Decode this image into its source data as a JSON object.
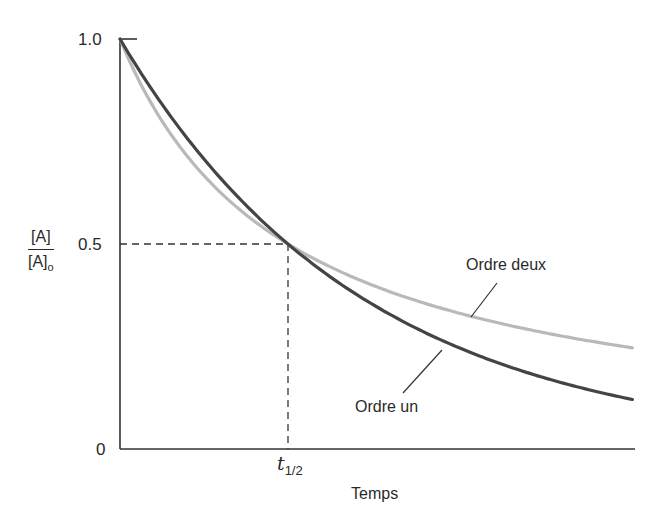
{
  "chart_data": {
    "type": "line",
    "title": "",
    "xlabel": "Temps",
    "ylabel": "[A]/[A]o",
    "ylabel_parts": {
      "numerator": "[A]",
      "denominator": "[A]",
      "denominator_sub": "o"
    },
    "yticks": [
      "0",
      "0.5",
      "1.0"
    ],
    "xticks": [
      {
        "label": "t",
        "sub": "1/2",
        "x": 1
      }
    ],
    "ylim": [
      0,
      1.0
    ],
    "xlim": [
      0,
      3.05
    ],
    "x_units": "multiples of t1/2",
    "grid": false,
    "guides": {
      "dashed_h_at": 0.5,
      "dashed_v_at": 1
    },
    "series": [
      {
        "name": "Ordre un",
        "color": "#444444",
        "formula": "0.5^t",
        "x": [
          0,
          0.5,
          1,
          1.5,
          2,
          2.5,
          3.05
        ],
        "values": [
          1.0,
          0.707,
          0.5,
          0.354,
          0.25,
          0.177,
          0.121
        ]
      },
      {
        "name": "Ordre deux",
        "color": "#b9b9b9",
        "formula": "1/(1+t)",
        "x": [
          0,
          0.5,
          1,
          1.5,
          2,
          2.5,
          3.05
        ],
        "values": [
          1.0,
          0.667,
          0.5,
          0.4,
          0.333,
          0.286,
          0.247
        ]
      }
    ],
    "annotations": [
      {
        "text": "Ordre deux",
        "points_to": "Ordre deux"
      },
      {
        "text": "Ordre un",
        "points_to": "Ordre un"
      }
    ]
  },
  "labels": {
    "y_top": "1.0",
    "y_mid": "0.5",
    "y_zero": "0",
    "y_num": "[A]",
    "y_den": "[A]",
    "y_den_sub": "o",
    "t": "t",
    "t_sub": "1/2",
    "xlabel": "Temps",
    "second_order": "Ordre deux",
    "first_order": "Ordre un"
  }
}
